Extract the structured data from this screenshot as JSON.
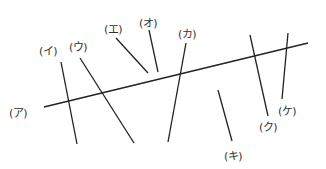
{
  "diagram": {
    "stroke_color": "#222222",
    "main_line": {
      "label": "(ア)",
      "x1": 44,
      "y1": 107,
      "x2": 308,
      "y2": 43,
      "label_x": 18,
      "label_y": 112
    },
    "crossing_lines": [
      {
        "label": "(イ)",
        "x1": 61,
        "y1": 62,
        "x2": 77,
        "y2": 144,
        "label_x": 48,
        "label_y": 50
      },
      {
        "label": "(ウ)",
        "x1": 80,
        "y1": 58,
        "x2": 134,
        "y2": 143,
        "label_x": 78,
        "label_y": 46
      },
      {
        "label": "(エ)",
        "x1": 116,
        "y1": 38,
        "x2": 148,
        "y2": 73,
        "label_x": 113,
        "label_y": 28
      },
      {
        "label": "(オ)",
        "x1": 149,
        "y1": 30,
        "x2": 158,
        "y2": 72,
        "label_x": 148,
        "label_y": 22
      },
      {
        "label": "(カ)",
        "x1": 186,
        "y1": 43,
        "x2": 168,
        "y2": 142,
        "label_x": 187,
        "label_y": 33
      },
      {
        "label": "(キ)",
        "x1": 218,
        "y1": 90,
        "x2": 232,
        "y2": 141,
        "label_x": 233,
        "label_y": 155
      },
      {
        "label": "(ク)",
        "x1": 250,
        "y1": 35,
        "x2": 268,
        "y2": 116,
        "label_x": 268,
        "label_y": 126
      },
      {
        "label": "(ケ)",
        "x1": 288,
        "y1": 33,
        "x2": 282,
        "y2": 99,
        "label_x": 287,
        "label_y": 110
      }
    ]
  }
}
